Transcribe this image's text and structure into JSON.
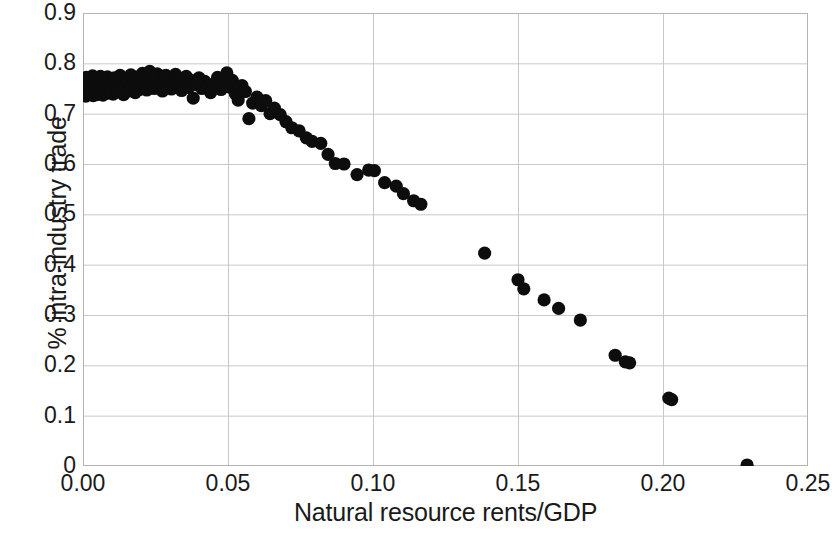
{
  "chart_data": {
    "type": "scatter",
    "title": "",
    "xlabel": "Natural resource rents/GDP",
    "ylabel": "% intra-industry trade",
    "xlim": [
      0,
      0.25
    ],
    "ylim": [
      0,
      0.9
    ],
    "xticks": [
      "0.00",
      "0.05",
      "0.10",
      "0.15",
      "0.20",
      "0.25"
    ],
    "xtick_values": [
      0,
      0.05,
      0.1,
      0.15,
      0.2,
      0.25
    ],
    "yticks": [
      "0",
      "0.1",
      "0.2",
      "0.3",
      "0.4",
      "0.5",
      "0.6",
      "0.7",
      "0.8",
      "0.9"
    ],
    "ytick_values": [
      0,
      0.1,
      0.2,
      0.3,
      0.4,
      0.5,
      0.6,
      0.7,
      0.8,
      0.9
    ],
    "grid": true,
    "grid_color": "#c8c8c8",
    "axis_color": "#b4b4b4",
    "legend": null,
    "marker": {
      "shape": "circle",
      "color": "#0d0d0d",
      "radius_px": 6.6
    },
    "series": [
      {
        "name": "countries",
        "points": [
          [
            0.0005,
            0.748
          ],
          [
            0.0008,
            0.76
          ],
          [
            0.001,
            0.735
          ],
          [
            0.0012,
            0.772
          ],
          [
            0.0015,
            0.745
          ],
          [
            0.0018,
            0.757
          ],
          [
            0.002,
            0.768
          ],
          [
            0.0022,
            0.74
          ],
          [
            0.0025,
            0.752
          ],
          [
            0.0028,
            0.764
          ],
          [
            0.003,
            0.744
          ],
          [
            0.0033,
            0.775
          ],
          [
            0.0035,
            0.736
          ],
          [
            0.0038,
            0.758
          ],
          [
            0.004,
            0.77
          ],
          [
            0.0043,
            0.747
          ],
          [
            0.0046,
            0.761
          ],
          [
            0.0048,
            0.738
          ],
          [
            0.0051,
            0.753
          ],
          [
            0.0054,
            0.766
          ],
          [
            0.0057,
            0.742
          ],
          [
            0.006,
            0.774
          ],
          [
            0.0063,
            0.75
          ],
          [
            0.0066,
            0.762
          ],
          [
            0.0069,
            0.737
          ],
          [
            0.0072,
            0.756
          ],
          [
            0.0075,
            0.769
          ],
          [
            0.0078,
            0.744
          ],
          [
            0.0081,
            0.759
          ],
          [
            0.0084,
            0.773
          ],
          [
            0.0087,
            0.741
          ],
          [
            0.009,
            0.754
          ],
          [
            0.0093,
            0.767
          ],
          [
            0.0096,
            0.746
          ],
          [
            0.01,
            0.763
          ],
          [
            0.0104,
            0.739
          ],
          [
            0.0108,
            0.771
          ],
          [
            0.0112,
            0.751
          ],
          [
            0.0116,
            0.758
          ],
          [
            0.012,
            0.743
          ],
          [
            0.0124,
            0.765
          ],
          [
            0.0128,
            0.776
          ],
          [
            0.0132,
            0.749
          ],
          [
            0.0136,
            0.76
          ],
          [
            0.014,
            0.738
          ],
          [
            0.0145,
            0.755
          ],
          [
            0.015,
            0.77
          ],
          [
            0.0155,
            0.745
          ],
          [
            0.016,
            0.762
          ],
          [
            0.0165,
            0.777
          ],
          [
            0.017,
            0.752
          ],
          [
            0.0175,
            0.766
          ],
          [
            0.018,
            0.742
          ],
          [
            0.0185,
            0.758
          ],
          [
            0.019,
            0.773
          ],
          [
            0.0195,
            0.748
          ],
          [
            0.02,
            0.764
          ],
          [
            0.0205,
            0.78
          ],
          [
            0.021,
            0.754
          ],
          [
            0.0215,
            0.769
          ],
          [
            0.022,
            0.747
          ],
          [
            0.0225,
            0.761
          ],
          [
            0.023,
            0.784
          ],
          [
            0.0235,
            0.756
          ],
          [
            0.024,
            0.772
          ],
          [
            0.0245,
            0.75
          ],
          [
            0.025,
            0.765
          ],
          [
            0.0256,
            0.779
          ],
          [
            0.0262,
            0.753
          ],
          [
            0.0268,
            0.768
          ],
          [
            0.0274,
            0.745
          ],
          [
            0.028,
            0.762
          ],
          [
            0.0286,
            0.776
          ],
          [
            0.0292,
            0.757
          ],
          [
            0.0298,
            0.77
          ],
          [
            0.0305,
            0.749
          ],
          [
            0.0312,
            0.764
          ],
          [
            0.0319,
            0.778
          ],
          [
            0.0326,
            0.755
          ],
          [
            0.0333,
            0.769
          ],
          [
            0.034,
            0.746
          ],
          [
            0.0348,
            0.761
          ],
          [
            0.0356,
            0.774
          ],
          [
            0.0364,
            0.752
          ],
          [
            0.0372,
            0.766
          ],
          [
            0.038,
            0.731
          ],
          [
            0.039,
            0.758
          ],
          [
            0.04,
            0.771
          ],
          [
            0.041,
            0.75
          ],
          [
            0.042,
            0.764
          ],
          [
            0.043,
            0.755
          ],
          [
            0.044,
            0.742
          ],
          [
            0.0452,
            0.759
          ],
          [
            0.0464,
            0.772
          ],
          [
            0.0476,
            0.748
          ],
          [
            0.0488,
            0.762
          ],
          [
            0.0496,
            0.781
          ],
          [
            0.0505,
            0.753
          ],
          [
            0.0515,
            0.766
          ],
          [
            0.0525,
            0.74
          ],
          [
            0.0535,
            0.727
          ],
          [
            0.0548,
            0.756
          ],
          [
            0.056,
            0.744
          ],
          [
            0.0572,
            0.69
          ],
          [
            0.0585,
            0.721
          ],
          [
            0.06,
            0.733
          ],
          [
            0.0615,
            0.716
          ],
          [
            0.063,
            0.726
          ],
          [
            0.0645,
            0.7
          ],
          [
            0.066,
            0.711
          ],
          [
            0.068,
            0.698
          ],
          [
            0.07,
            0.684
          ],
          [
            0.072,
            0.672
          ],
          [
            0.0745,
            0.666
          ],
          [
            0.077,
            0.652
          ],
          [
            0.079,
            0.645
          ],
          [
            0.082,
            0.641
          ],
          [
            0.0845,
            0.619
          ],
          [
            0.087,
            0.601
          ],
          [
            0.09,
            0.6
          ],
          [
            0.0945,
            0.579
          ],
          [
            0.0985,
            0.588
          ],
          [
            0.1005,
            0.587
          ],
          [
            0.104,
            0.563
          ],
          [
            0.108,
            0.556
          ],
          [
            0.1105,
            0.541
          ],
          [
            0.114,
            0.527
          ],
          [
            0.1165,
            0.52
          ],
          [
            0.1385,
            0.423
          ],
          [
            0.15,
            0.37
          ],
          [
            0.152,
            0.352
          ],
          [
            0.159,
            0.33
          ],
          [
            0.164,
            0.313
          ],
          [
            0.1715,
            0.29
          ],
          [
            0.1835,
            0.22
          ],
          [
            0.187,
            0.207
          ],
          [
            0.1885,
            0.205
          ],
          [
            0.202,
            0.135
          ],
          [
            0.203,
            0.132
          ],
          [
            0.229,
            0.002
          ]
        ]
      }
    ]
  },
  "axes": {
    "plot": {
      "left_px": 83,
      "top_px": 13,
      "width_px": 725,
      "height_px": 453
    }
  }
}
